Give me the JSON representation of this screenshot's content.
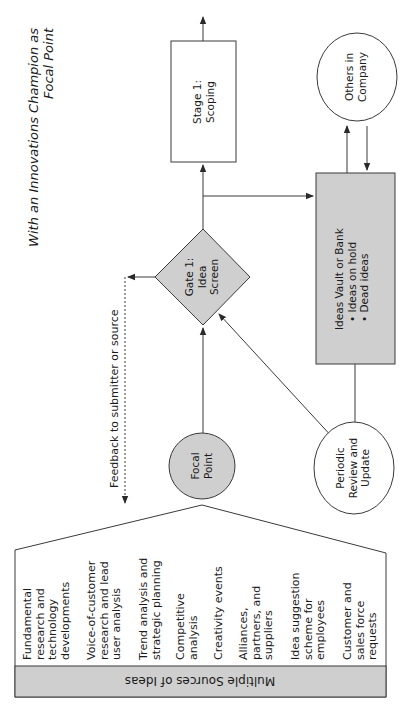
{
  "title": {
    "line1": "With an Innovations Champion as",
    "line2": "Focal Point"
  },
  "nodes": {
    "stage1": {
      "line1": "Stage 1:",
      "line2": "Scoping"
    },
    "gate1": {
      "line1": "Gate 1:",
      "line2": "Idea",
      "line3": "Screen"
    },
    "focal_point": {
      "line1": "Focal",
      "line2": "Point"
    },
    "others": {
      "line1": "Others in",
      "line2": "Company"
    },
    "vault": {
      "title": "Ideas Vault or Bank",
      "bullets": [
        "• Ideas on hold",
        "• Dead ideas"
      ]
    },
    "periodic": {
      "line1": "Periodic",
      "line2": "Review and",
      "line3": "Update"
    }
  },
  "feedback_label": "Feedback to submitter or source",
  "sources": {
    "header": "Multiple Sources of Ideas",
    "items": [
      {
        "lines": [
          "Fundamental",
          "research and",
          "technology",
          "developments"
        ]
      },
      {
        "lines": [
          "Voice-of-customer",
          "research and lead",
          "user analysis"
        ]
      },
      {
        "lines": [
          "Trend analysis and",
          "strategic planning"
        ]
      },
      {
        "lines": [
          "Competitive",
          "analysis"
        ]
      },
      {
        "lines": [
          "Creativity events"
        ]
      },
      {
        "lines": [
          "Alliances,",
          "partners, and",
          "suppliers"
        ]
      },
      {
        "lines": [
          "Idea suggestion",
          "scheme for",
          "employees"
        ]
      },
      {
        "lines": [
          "Customer and",
          "sales force",
          "requests"
        ]
      }
    ]
  },
  "colors": {
    "shape_fill": "#cfcfcf",
    "line": "#3a3a3a",
    "background": "#ffffff"
  }
}
